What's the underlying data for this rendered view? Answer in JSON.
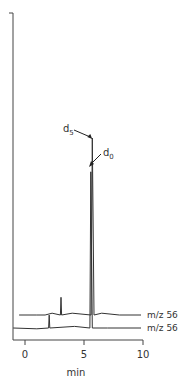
{
  "chart_data": {
    "type": "line",
    "title": "",
    "xlabel": "min",
    "ylabel": "",
    "xlim": [
      -1.2,
      10
    ],
    "xticks": [
      0,
      5,
      10
    ],
    "xtick_labels": [
      "0",
      "5",
      "10"
    ],
    "grid": false,
    "series": [
      {
        "name": "m/z 560",
        "label": "m/z 560",
        "points": [
          [
            -0.5,
            0.0
          ],
          [
            1.0,
            0.0
          ],
          [
            1.7,
            0.0
          ],
          [
            2.3,
            0.01
          ],
          [
            3.0,
            0.0
          ],
          [
            3.05,
            0.1
          ],
          [
            3.1,
            0.0
          ],
          [
            4.0,
            0.01
          ],
          [
            5.6,
            0.0
          ],
          [
            5.7,
            1.0
          ],
          [
            5.85,
            0.0
          ],
          [
            6.5,
            0.01
          ],
          [
            8.0,
            0.0
          ],
          [
            10.0,
            0.0
          ]
        ]
      },
      {
        "name": "m/z 565",
        "label": "m/z 565",
        "points": [
          [
            -1.0,
            0.0
          ],
          [
            1.0,
            -0.005
          ],
          [
            2.0,
            0.0
          ],
          [
            2.05,
            0.08
          ],
          [
            2.1,
            0.0
          ],
          [
            4.2,
            0.01
          ],
          [
            5.5,
            0.0
          ],
          [
            5.58,
            0.97
          ],
          [
            5.7,
            0.0
          ],
          [
            7.0,
            0.0
          ],
          [
            10.0,
            0.0
          ]
        ]
      }
    ],
    "annotations": [
      {
        "text": "d5",
        "sub": "5",
        "base": "d",
        "target_series": "m/z 560",
        "x": 5.45
      },
      {
        "text": "d0",
        "sub": "0",
        "base": "d",
        "target_series": "m/z 565",
        "x": 5.75
      }
    ]
  }
}
